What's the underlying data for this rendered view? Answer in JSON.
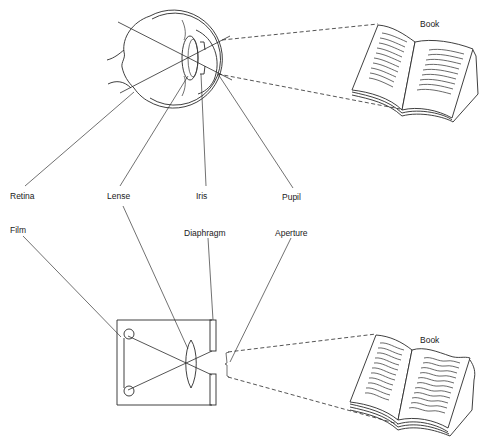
{
  "diagram": {
    "eye": {
      "labels": {
        "retina": "Retina",
        "lense": "Lense",
        "iris": "Iris",
        "pupil": "Pupil",
        "book": "Book"
      }
    },
    "camera": {
      "labels": {
        "film": "Film",
        "diaphragm": "Diaphragm",
        "aperture": "Aperture",
        "book": "Book"
      }
    },
    "colors": {
      "line": "#2a2a2a",
      "background": "#ffffff"
    }
  }
}
